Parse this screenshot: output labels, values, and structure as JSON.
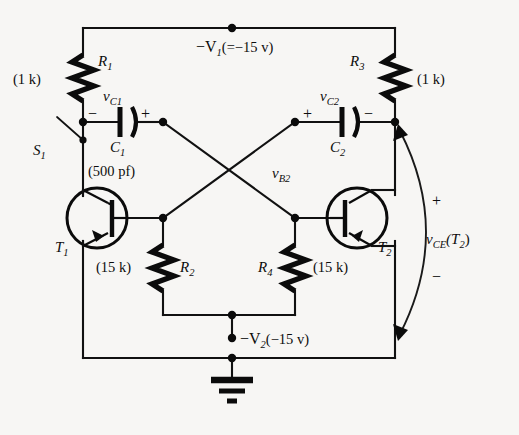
{
  "figure": {
    "type": "circuit-schematic",
    "background_color": "#f7f6f4",
    "ink_color": "#0b0b0b"
  },
  "labels": {
    "supply_top": {
      "name": "-V1",
      "value": "(= -15 v)",
      "full": "−V"
    },
    "supply_top_sub": "1",
    "supply_top_value": "(=−15 v)",
    "supply_bottom_name": "−V",
    "supply_bottom_sub": "2",
    "supply_bottom_value": "(−15 v)"
  },
  "components": {
    "resistors": [
      {
        "id": "R1",
        "letter": "R",
        "sub": "1",
        "value": "(1 k)"
      },
      {
        "id": "R2",
        "letter": "R",
        "sub": "2",
        "value": "(15 k)"
      },
      {
        "id": "R3",
        "letter": "R",
        "sub": "3",
        "value": "(1 k)"
      },
      {
        "id": "R4",
        "letter": "R",
        "sub": "4",
        "value": "(15 k)"
      }
    ],
    "capacitors": [
      {
        "id": "C1",
        "letter": "C",
        "sub": "1",
        "value": "(500 pf)",
        "voltage_letter": "v",
        "voltage_sub": "C1",
        "left_sign": "−",
        "right_sign": "+"
      },
      {
        "id": "C2",
        "letter": "C",
        "sub": "2",
        "value": "",
        "voltage_letter": "v",
        "voltage_sub": "C2",
        "left_sign": "+",
        "right_sign": "−"
      }
    ],
    "transistors": [
      {
        "id": "T1",
        "letter": "T",
        "sub": "1",
        "type": "pnp"
      },
      {
        "id": "T2",
        "letter": "T",
        "sub": "2",
        "type": "pnp"
      }
    ],
    "switch": {
      "id": "S1",
      "letter": "S",
      "sub": "1",
      "state": "open"
    },
    "ground": {
      "name": "ground-symbol"
    }
  },
  "annotations": {
    "vb2_letter": "v",
    "vb2_sub": "B2",
    "vce_letter": "v",
    "vce_sub": "CE",
    "vce_of": "(T",
    "vce_of_sub": "2",
    "vce_of_close": ")",
    "vce_plus": "+",
    "vce_minus": "−"
  }
}
